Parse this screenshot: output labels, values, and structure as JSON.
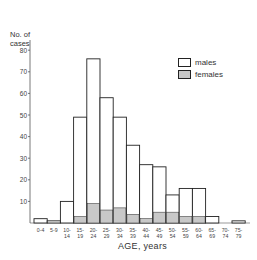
{
  "chart_data": {
    "type": "bar",
    "stacked_overlay": true,
    "title": "",
    "xlabel": "AGE, years",
    "ylabel": "No. of cases",
    "ylim": [
      0,
      85
    ],
    "yticks": [
      10,
      20,
      30,
      40,
      50,
      60,
      70,
      80
    ],
    "grid": false,
    "legend_position": "upper right",
    "categories": [
      "0-4",
      "5-9",
      "10-14",
      "15-19",
      "20-24",
      "25-29",
      "30-34",
      "35-39",
      "40-44",
      "45-49",
      "50-54",
      "55-59",
      "60-64",
      "65-69",
      "70-74",
      "75-79"
    ],
    "category_labels": [
      [
        "0-4",
        ""
      ],
      [
        "5-9",
        ""
      ],
      [
        "10-",
        "14"
      ],
      [
        "15-",
        "19"
      ],
      [
        "20-",
        "24"
      ],
      [
        "25-",
        "29"
      ],
      [
        "30-",
        "34"
      ],
      [
        "35-",
        "39"
      ],
      [
        "40-",
        "44"
      ],
      [
        "45-",
        "49"
      ],
      [
        "50-",
        "54"
      ],
      [
        "55-",
        "59"
      ],
      [
        "60-",
        "64"
      ],
      [
        "65-",
        "69"
      ],
      [
        "70-",
        "74"
      ],
      [
        "75-",
        "79"
      ]
    ],
    "series": [
      {
        "name": "males",
        "color": "#ffffff",
        "values": [
          2,
          1,
          10,
          49,
          76,
          58,
          49,
          36,
          27,
          26,
          13,
          16,
          16,
          3,
          0,
          1
        ]
      },
      {
        "name": "females",
        "color": "#c8c8c8",
        "values": [
          0,
          0,
          0,
          3,
          9,
          6,
          7,
          4,
          2,
          5,
          5,
          3,
          3,
          0,
          0,
          0
        ]
      }
    ]
  },
  "labels": {
    "ylabel_line1": "No. of",
    "ylabel_line2": "cases",
    "xlabel": "AGE, years",
    "legend_males": "males",
    "legend_females": "females"
  }
}
